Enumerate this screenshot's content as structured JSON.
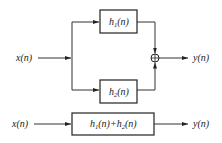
{
  "diagram": {
    "parallel": {
      "input_label": "x(n)",
      "output_label": "y(n)",
      "block_top": {
        "base": "h",
        "sub": "1",
        "arg": "(n)"
      },
      "block_bottom": {
        "base": "h",
        "sub": "2",
        "arg": "(n)"
      },
      "adder_icon": "summing-junction"
    },
    "equivalent": {
      "input_label": "x(n)",
      "output_label": "y(n)",
      "block": {
        "t1_base": "h",
        "t1_sub": "1",
        "t1_arg": "(n)",
        "plus": "+",
        "t2_base": "h",
        "t2_sub": "2",
        "t2_arg": "(n)"
      }
    }
  }
}
